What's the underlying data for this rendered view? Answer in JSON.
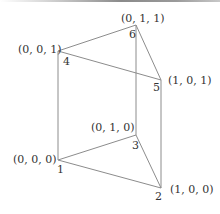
{
  "diagram": {
    "vertices": [
      {
        "id": "1",
        "number": "1",
        "coord": "(0, 0, 0)",
        "x": 58,
        "y": 160
      },
      {
        "id": "2",
        "number": "2",
        "coord": "(1, 0, 0)",
        "x": 161,
        "y": 188
      },
      {
        "id": "3",
        "number": "3",
        "coord": "(0, 1, 0)",
        "x": 136,
        "y": 135
      },
      {
        "id": "4",
        "number": "4",
        "coord": "(0, 0, 1)",
        "x": 58,
        "y": 51
      },
      {
        "id": "5",
        "number": "5",
        "coord": "(1, 0, 1)",
        "x": 161,
        "y": 80
      },
      {
        "id": "6",
        "number": "6",
        "coord": "(0, 1, 1)",
        "x": 136,
        "y": 25
      }
    ],
    "edges": [
      [
        "1",
        "2"
      ],
      [
        "2",
        "3"
      ],
      [
        "3",
        "1"
      ],
      [
        "4",
        "5"
      ],
      [
        "5",
        "6"
      ],
      [
        "6",
        "4"
      ],
      [
        "1",
        "4"
      ],
      [
        "2",
        "5"
      ],
      [
        "3",
        "6"
      ]
    ],
    "colors": {
      "edge": "#8c8c8c",
      "text": "#333333",
      "background": "#ffffff"
    }
  }
}
